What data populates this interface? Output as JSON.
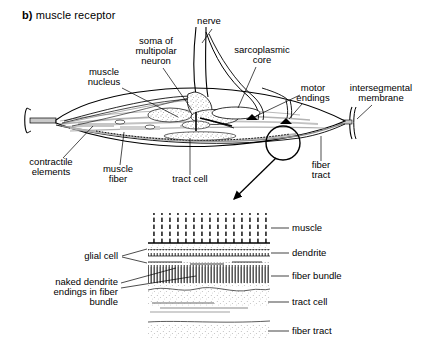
{
  "figure": {
    "panel_letter": "b)",
    "title": "muscle receptor",
    "type": "anatomical-line-diagram",
    "colors": {
      "ink": "#000000",
      "background": "#ffffff",
      "shading_gray": "#b9b9b9",
      "light_gray": "#d8d8d8"
    }
  },
  "upper_diagram": {
    "name": "muscle receptor overview",
    "labels": [
      {
        "id": "nerve",
        "text": "nerve"
      },
      {
        "id": "soma-of-multipolar-neuron",
        "text": "soma of\nmultipolar\nneuron",
        "lines": [
          "soma of",
          "multipolar",
          "neuron"
        ]
      },
      {
        "id": "sarcoplasmic-core",
        "text": "sarcoplasmic\ncore",
        "lines": [
          "sarcoplasmic",
          "core"
        ]
      },
      {
        "id": "muscle-nucleus",
        "text": "muscle\nnucleus",
        "lines": [
          "muscle",
          "nucleus"
        ]
      },
      {
        "id": "motor-endings",
        "text": "motor\nendings",
        "lines": [
          "motor",
          "endings"
        ]
      },
      {
        "id": "intersegmental-membrane",
        "text": "intersegmental\nmembrane",
        "lines": [
          "intersegmental",
          "membrane"
        ]
      },
      {
        "id": "contractile-elements",
        "text": "contractile\nelements",
        "lines": [
          "contractile",
          "elements"
        ]
      },
      {
        "id": "muscle-fiber",
        "text": "muscle\nfiber",
        "lines": [
          "muscle",
          "fiber"
        ]
      },
      {
        "id": "tract-cell",
        "text": "tract cell"
      },
      {
        "id": "fiber-tract",
        "text": "fiber\ntract",
        "lines": [
          "fiber",
          "tract"
        ]
      }
    ],
    "callout": {
      "shape": "circle",
      "description": "magnification circle on fiber tract with arrow to inset"
    }
  },
  "inset_diagram": {
    "name": "magnified cross-section of fiber tract",
    "left_labels": [
      {
        "id": "glial-cell",
        "text": "glial cell"
      },
      {
        "id": "naked-dendrite-endings",
        "text": "naked dendrite\nendings in fiber\nbundle",
        "lines": [
          "naked dendrite",
          "endings in fiber",
          "bundle"
        ]
      }
    ],
    "right_labels": [
      {
        "id": "muscle",
        "text": "muscle"
      },
      {
        "id": "dendrite",
        "text": "dendrite"
      },
      {
        "id": "fiber-bundle",
        "text": "fiber bundle"
      },
      {
        "id": "tract-cell",
        "text": "tract cell"
      },
      {
        "id": "fiber-tract",
        "text": "fiber tract"
      }
    ],
    "bands": [
      {
        "id": "muscle-band",
        "texture": "vertical dashed striations"
      },
      {
        "id": "dendrite-band",
        "texture": "fine dotted row"
      },
      {
        "id": "fiber-bundle-band",
        "texture": "dense vertical hatching"
      },
      {
        "id": "tract-cell-band",
        "texture": "stipple with wavy outline"
      },
      {
        "id": "fiber-tract-band",
        "texture": "stipple"
      }
    ]
  }
}
